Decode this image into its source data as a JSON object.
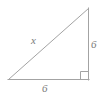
{
  "figure": {
    "name": "right-triangle",
    "background_color": "#ffffff",
    "stroke_color": "#a3a3a3",
    "label_color": "#7a7a7a",
    "stroke_width": 1,
    "geometry": {
      "left_vertex": [
        8,
        80
      ],
      "bottom_right_vertex": [
        88,
        80
      ],
      "top_vertex": [
        88,
        8
      ],
      "right_angle_marker": {
        "size": 8,
        "corner": [
          88,
          80
        ]
      }
    },
    "labels": {
      "hypotenuse": "x",
      "vertical_leg": "6",
      "base": "6"
    }
  }
}
